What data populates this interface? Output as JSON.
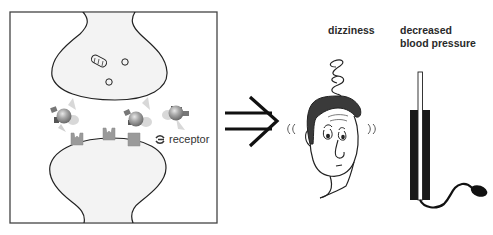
{
  "diagram": {
    "panels": [
      {
        "id": "synapse",
        "description": "Synapse cross-section: presynaptic terminal with vesicles and mitochondrion above, postsynaptic membrane with receptors below, drug molecules in the cleft",
        "legend": {
          "receptor_label": "receptor",
          "receptor_icon": "receptor-symbol-icon"
        },
        "elements": {
          "presynaptic_terminal": {
            "vesicles": 2,
            "mitochondria": 1
          },
          "drug_molecules": 4,
          "receptors": 3
        }
      },
      {
        "id": "arrow",
        "description": "Double-line implication arrow pointing right",
        "icon": "double-arrow-right-icon"
      },
      {
        "id": "effect-dizziness",
        "label": "dizziness",
        "icon": "dizzy-face-icon"
      },
      {
        "id": "effect-blood-pressure",
        "label_lines": [
          "decreased",
          "blood pressure"
        ],
        "icon": "sphygmomanometer-icon"
      }
    ],
    "colors": {
      "outline": "#222222",
      "cell_fill": "#f3f3f3",
      "receptor_fill": "#9a9a9a",
      "molecule_core": "#8a8a8a",
      "hair": "#3a3a3a",
      "manometer_body": "#1a1a1a"
    }
  }
}
